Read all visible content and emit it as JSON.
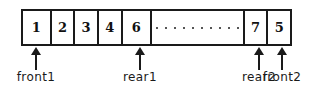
{
  "figure": {
    "colors": {
      "stroke": "#1a1a1a",
      "background": "#ffffff",
      "dots": "#555555",
      "text": "#111111"
    }
  },
  "array": {
    "cells": [
      {
        "value": "1",
        "width": 29,
        "kind": "value"
      },
      {
        "value": "2",
        "width": 24,
        "kind": "value"
      },
      {
        "value": "3",
        "width": 24,
        "kind": "value"
      },
      {
        "value": "4",
        "width": 24,
        "kind": "value"
      },
      {
        "value": "6",
        "width": 30,
        "kind": "value"
      },
      {
        "value": "",
        "width": 94,
        "kind": "gap"
      },
      {
        "value": "7",
        "width": 24,
        "kind": "value"
      },
      {
        "value": "5",
        "width": 22,
        "kind": "value"
      }
    ]
  },
  "pointers": [
    {
      "label": "front1",
      "x": 35,
      "cell_index": 0
    },
    {
      "label": "rear1",
      "x": 139,
      "cell_index": 4
    },
    {
      "label": "rear2",
      "x": 258,
      "cell_index": 6
    },
    {
      "label": "front2",
      "x": 281,
      "cell_index": 7
    }
  ]
}
